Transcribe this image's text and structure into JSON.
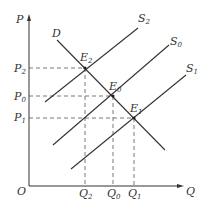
{
  "diagram": {
    "type": "supply-demand",
    "colors": {
      "line": "#333333",
      "dashed": "#555555",
      "background": "#ffffff"
    },
    "axes": {
      "origin": {
        "label": "O"
      },
      "y": {
        "label": "P"
      },
      "x": {
        "label": "Q"
      }
    },
    "price_levels": [
      {
        "id": "P2",
        "base": "P",
        "sub": "2"
      },
      {
        "id": "P0",
        "base": "P",
        "sub": "0"
      },
      {
        "id": "P1",
        "base": "P",
        "sub": "1"
      }
    ],
    "quantity_levels": [
      {
        "id": "Q2",
        "base": "Q",
        "sub": "2"
      },
      {
        "id": "Q0",
        "base": "Q",
        "sub": "0"
      },
      {
        "id": "Q1",
        "base": "Q",
        "sub": "1"
      }
    ],
    "curves": {
      "demand": {
        "label": "D"
      },
      "supply": [
        {
          "id": "S2",
          "base": "S",
          "sub": "2"
        },
        {
          "id": "S0",
          "base": "S",
          "sub": "0"
        },
        {
          "id": "S1",
          "base": "S",
          "sub": "1"
        }
      ]
    },
    "equilibria": [
      {
        "id": "E2",
        "base": "E",
        "sub": "2",
        "price": "P2",
        "quantity": "Q2"
      },
      {
        "id": "E0",
        "base": "E",
        "sub": "0",
        "price": "P0",
        "quantity": "Q0"
      },
      {
        "id": "E1",
        "base": "E",
        "sub": "1",
        "price": "P1",
        "quantity": "Q1"
      }
    ]
  }
}
